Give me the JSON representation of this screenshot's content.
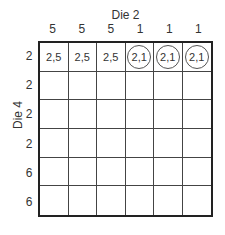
{
  "title": "Die 2",
  "side_title": "Die 4",
  "columns": [
    "5",
    "5",
    "5",
    "1",
    "1",
    "1"
  ],
  "rows": [
    "2",
    "2",
    "2",
    "2",
    "6",
    "6"
  ],
  "cells": [
    [
      {
        "text": "2,5",
        "circled": false
      },
      {
        "text": "2,5",
        "circled": false
      },
      {
        "text": "2,5",
        "circled": false
      },
      {
        "text": "2,1",
        "circled": true
      },
      {
        "text": "2,1",
        "circled": true
      },
      {
        "text": "2,1",
        "circled": true
      }
    ],
    [
      {
        "text": "",
        "circled": false
      },
      {
        "text": "",
        "circled": false
      },
      {
        "text": "",
        "circled": false
      },
      {
        "text": "",
        "circled": false
      },
      {
        "text": "",
        "circled": false
      },
      {
        "text": "",
        "circled": false
      }
    ],
    [
      {
        "text": "",
        "circled": false
      },
      {
        "text": "",
        "circled": false
      },
      {
        "text": "",
        "circled": false
      },
      {
        "text": "",
        "circled": false
      },
      {
        "text": "",
        "circled": false
      },
      {
        "text": "",
        "circled": false
      }
    ],
    [
      {
        "text": "",
        "circled": false
      },
      {
        "text": "",
        "circled": false
      },
      {
        "text": "",
        "circled": false
      },
      {
        "text": "",
        "circled": false
      },
      {
        "text": "",
        "circled": false
      },
      {
        "text": "",
        "circled": false
      }
    ],
    [
      {
        "text": "",
        "circled": false
      },
      {
        "text": "",
        "circled": false
      },
      {
        "text": "",
        "circled": false
      },
      {
        "text": "",
        "circled": false
      },
      {
        "text": "",
        "circled": false
      },
      {
        "text": "",
        "circled": false
      }
    ],
    [
      {
        "text": "",
        "circled": false
      },
      {
        "text": "",
        "circled": false
      },
      {
        "text": "",
        "circled": false
      },
      {
        "text": "",
        "circled": false
      },
      {
        "text": "",
        "circled": false
      },
      {
        "text": "",
        "circled": false
      }
    ]
  ]
}
